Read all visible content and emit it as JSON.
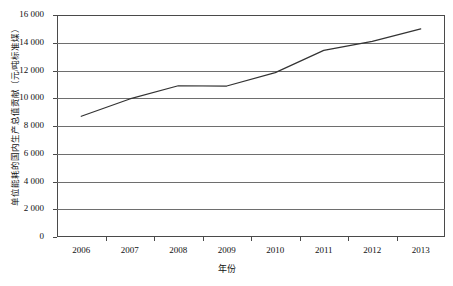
{
  "chart_data": {
    "type": "line",
    "title": "",
    "subtitle": "",
    "xlabel": "年份",
    "ylabel": "单位能耗的国内生产总值贡献（元/吨标准煤）",
    "categories": [
      "2006",
      "2007",
      "2008",
      "2009",
      "2010",
      "2011",
      "2012",
      "2013"
    ],
    "series": [
      {
        "name": "单位能耗的国内生产总值贡献",
        "values": [
          8700,
          9950,
          10900,
          10880,
          11850,
          13450,
          14100,
          15000
        ]
      }
    ],
    "ylim": [
      0,
      16000
    ],
    "ytick_values": [
      0,
      2000,
      4000,
      6000,
      8000,
      10000,
      12000,
      14000,
      16000
    ],
    "ytick_labels": [
      "0",
      "2 000",
      "4 000",
      "6 000",
      "8 000",
      "10 000",
      "12 000",
      "14 000",
      "16 000"
    ],
    "grid": true,
    "grid_axis": "y",
    "legend": false,
    "legend_position": "none",
    "line_color": "#333333",
    "line_width": 1.2,
    "markers": false,
    "axis_color": "#4a4a4a",
    "background_color": "#ffffff"
  }
}
